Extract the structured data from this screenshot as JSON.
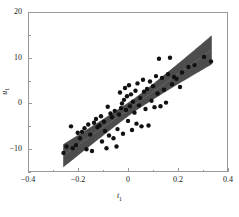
{
  "chart_data": {
    "type": "scatter",
    "title": "",
    "subtitle": "",
    "xlabel": "t",
    "xlabel_sub": "1",
    "ylabel": "u",
    "ylabel_sub": "1",
    "xlim": [
      -0.4,
      0.4
    ],
    "ylim": [
      -15,
      20
    ],
    "grid": false,
    "legend": "none",
    "xticks": [
      -0.4,
      -0.2,
      0,
      0.2,
      0.4
    ],
    "xticklabels": [
      "-0.4",
      "-0.2",
      "0",
      "0.2",
      "0.4"
    ],
    "yticks": [
      -10,
      0,
      10,
      20
    ],
    "yticklabels": [
      "-10",
      "0",
      "10",
      "20"
    ],
    "x_minor_ticks": [
      -0.3,
      -0.1,
      0.1,
      0.3
    ],
    "y_minor_ticks": [
      -15,
      -5,
      5,
      15
    ],
    "marker_color": "#111111",
    "marker_size": 2.2,
    "band_color": "#4d4d4d",
    "band_edge_color": "#3a3a3a",
    "line_color": "#6e6e6e",
    "frame_color": "#9a9a9a",
    "regression": {
      "x_start": -0.262,
      "x_end": 0.33,
      "y_start": -11.2,
      "y_end": 11.9,
      "slope": 39.0,
      "intercept": -1.0
    },
    "confidence_band": {
      "description": "shaded confidence region about the fitted line, narrow near the data centroid and flaring at both ends",
      "half_width_center": 1.4,
      "half_width_left_end": 2.6,
      "half_width_right_end": 3.1,
      "x_center": 0.02
    },
    "series": [
      {
        "name": "observations",
        "points": [
          [
            -0.262,
            -10.6
          ],
          [
            -0.25,
            -9.2
          ],
          [
            -0.232,
            -4.8
          ],
          [
            -0.225,
            -9.6
          ],
          [
            -0.212,
            -8.9
          ],
          [
            -0.205,
            -6.2
          ],
          [
            -0.196,
            -7.4
          ],
          [
            -0.188,
            -6.0
          ],
          [
            -0.178,
            -5.2
          ],
          [
            -0.17,
            -9.8
          ],
          [
            -0.163,
            -4.4
          ],
          [
            -0.155,
            -6.6
          ],
          [
            -0.148,
            -10.2
          ],
          [
            -0.14,
            -4.0
          ],
          [
            -0.132,
            -3.2
          ],
          [
            -0.126,
            -5.0
          ],
          [
            -0.118,
            -4.6
          ],
          [
            -0.112,
            -2.6
          ],
          [
            -0.108,
            -8.1
          ],
          [
            -0.1,
            -3.8
          ],
          [
            -0.096,
            -5.8
          ],
          [
            -0.09,
            -9.6
          ],
          [
            -0.085,
            -0.5
          ],
          [
            -0.08,
            -6.8
          ],
          [
            -0.074,
            -2.0
          ],
          [
            -0.068,
            -2.8
          ],
          [
            -0.062,
            -7.4
          ],
          [
            -0.057,
            -1.4
          ],
          [
            -0.05,
            -9.2
          ],
          [
            -0.046,
            -5.4
          ],
          [
            -0.04,
            -2.2
          ],
          [
            -0.036,
            2.6
          ],
          [
            -0.032,
            -0.8
          ],
          [
            -0.028,
            0.2
          ],
          [
            -0.024,
            -6.4
          ],
          [
            -0.02,
            1.0
          ],
          [
            -0.016,
            3.6
          ],
          [
            -0.012,
            -1.2
          ],
          [
            -0.008,
            1.8
          ],
          [
            -0.004,
            -3.6
          ],
          [
            0.0,
            4.2
          ],
          [
            0.004,
            -0.4
          ],
          [
            0.008,
            2.2
          ],
          [
            0.012,
            -5.6
          ],
          [
            0.016,
            0.6
          ],
          [
            0.022,
            -1.8
          ],
          [
            0.026,
            3.0
          ],
          [
            0.03,
            -4.2
          ],
          [
            0.034,
            4.6
          ],
          [
            0.04,
            -0.2
          ],
          [
            0.045,
            1.4
          ],
          [
            0.05,
            -4.8
          ],
          [
            0.056,
            5.4
          ],
          [
            0.06,
            2.8
          ],
          [
            0.066,
            -1.0
          ],
          [
            0.072,
            3.4
          ],
          [
            0.078,
            -4.6
          ],
          [
            0.084,
            5.0
          ],
          [
            0.09,
            0.8
          ],
          [
            0.096,
            4.0
          ],
          [
            0.102,
            -0.6
          ],
          [
            0.108,
            6.2
          ],
          [
            0.114,
            2.4
          ],
          [
            0.12,
            10.0
          ],
          [
            0.126,
            -0.4
          ],
          [
            0.132,
            5.8
          ],
          [
            0.14,
            3.2
          ],
          [
            0.148,
            0.4
          ],
          [
            0.156,
            6.6
          ],
          [
            0.164,
            10.2
          ],
          [
            0.172,
            4.4
          ],
          [
            0.18,
            6.0
          ],
          [
            0.19,
            5.6
          ],
          [
            0.204,
            3.8
          ],
          [
            0.212,
            7.0
          ],
          [
            0.238,
            8.2
          ],
          [
            0.262,
            8.6
          ],
          [
            0.3,
            10.4
          ],
          [
            0.328,
            9.4
          ]
        ]
      }
    ]
  }
}
